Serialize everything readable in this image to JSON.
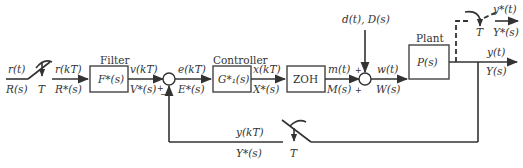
{
  "diagram": {
    "type": "sampled-data control system block diagram",
    "blocks": [
      {
        "id": "filter",
        "title": "Filter",
        "label": "F*(s)"
      },
      {
        "id": "controller",
        "title": "Controller",
        "label": "G*₁(s)"
      },
      {
        "id": "zoh",
        "title": "",
        "label": "ZOH"
      },
      {
        "id": "plant",
        "title": "Plant",
        "label": "P(s)"
      }
    ],
    "signals": {
      "input_time": "r(t)",
      "input_s": "R(s)",
      "sampled_input_time": "r(kT)",
      "sampled_input_s": "R*(s)",
      "filter_out_time": "v(kT)",
      "filter_out_s": "V*(s)",
      "error_time": "e(kT)",
      "error_s": "E*(s)",
      "controller_out_time": "x(kT)",
      "controller_out_s": "X*(s)",
      "zoh_out_time": "m(t)",
      "zoh_out_s": "M(s)",
      "disturbance": "d(t), D(s)",
      "plant_in_time": "w(t)",
      "plant_in_s": "W(s)",
      "output_time": "y(t)",
      "output_s": "Y(s)",
      "sampled_output_time": "y*(t)",
      "sampled_output_s": "Y*(s)",
      "feedback_time": "y(kT)",
      "feedback_s": "Y*(s)"
    },
    "samplers": {
      "input_period": "T",
      "output_period": "T",
      "feedback_period": "T"
    },
    "summing_junctions": {
      "error": {
        "plus": "+",
        "minus": "−"
      },
      "disturbance": {
        "plus_top": "+",
        "plus_left": "+"
      }
    },
    "colors": {
      "line": "#333333",
      "background": "#ffffff"
    }
  }
}
